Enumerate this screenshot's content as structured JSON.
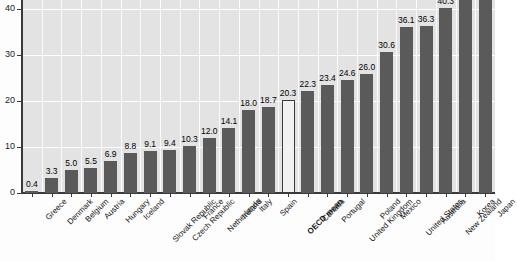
{
  "chart_data": {
    "type": "bar",
    "title": "",
    "subtitle": "",
    "xlabel": "",
    "ylabel": "",
    "ylim": [
      0,
      42
    ],
    "yticks": [
      0,
      10,
      20,
      30,
      40
    ],
    "grid": true,
    "legend": null,
    "note": "Korea and Japan bars are clipped by the top edge of the figure; their value labels are not visible.",
    "categories": [
      "Greece",
      "Denmark",
      "Belgium",
      "Austria",
      "Hungary",
      "Iceland",
      "Slovak Republic",
      "Czech Republic",
      "France",
      "Netherlands",
      "Ireland",
      "Italy",
      "Spain",
      "OECD mean",
      "Canada",
      "Portugal",
      "United Kingdom",
      "Poland",
      "Mexico",
      "United States",
      "Australia",
      "New Zealand",
      "Korea",
      "Japan"
    ],
    "values": [
      0.4,
      3.3,
      5.0,
      5.5,
      6.9,
      8.8,
      9.1,
      9.4,
      10.3,
      12.0,
      14.1,
      18.0,
      18.7,
      20.3,
      22.3,
      23.4,
      24.6,
      26.0,
      30.6,
      36.1,
      36.3,
      40.3,
      42.0,
      42.0
    ],
    "value_labels": [
      "0.4",
      "3.3",
      "5.0",
      "5.5",
      "6.9",
      "8.8",
      "9.1",
      "9.4",
      "10.3",
      "12.0",
      "14.1",
      "18.0",
      "18.7",
      "20.3",
      "22.3",
      "23.4",
      "24.6",
      "26.0",
      "30.6",
      "36.1",
      "36.3",
      "40.3",
      "",
      ""
    ],
    "highlight_index": 13,
    "bar_color": "#5a5a5a",
    "highlight_bar_color": "#f2f2f2",
    "plot_background": "#e3e3e3",
    "gridline_color": "#ffffff",
    "axis_color": "#3a3a3a"
  }
}
